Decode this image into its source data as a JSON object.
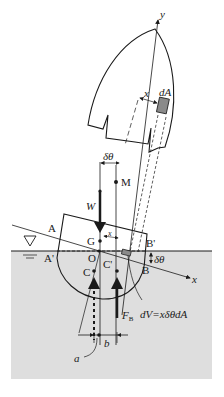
{
  "figure": {
    "type": "ship-stability-diagram",
    "colors": {
      "water": "#dedede",
      "line": "#1a1a1a",
      "element_fill": "#8a8a8a",
      "background": "#ffffff"
    },
    "axes": {
      "y_label": "y",
      "x_label": "x"
    },
    "labels": {
      "dA": "dA",
      "x_dist": "x",
      "x_small": "x",
      "dtheta_top": "δθ",
      "dtheta_right": "δθ",
      "M": "M",
      "W": "W",
      "A": "A",
      "A_prime": "A'",
      "B": "B",
      "B_prime": "B'",
      "G": "G",
      "O": "O",
      "C": "C",
      "C_prime": "C'",
      "F_B": "F",
      "F_B_sub": "B",
      "dV": "dV=xδθdA",
      "a": "a",
      "b": "b"
    },
    "water_symbol": "▽"
  }
}
